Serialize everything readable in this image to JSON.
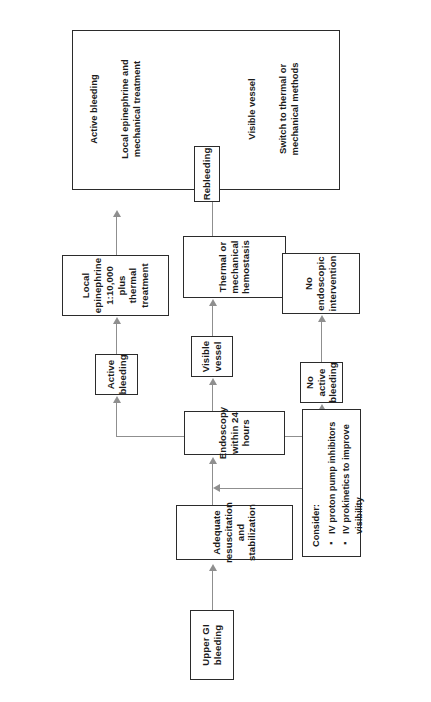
{
  "diagram": {
    "orientation_note": "rotated",
    "colors": {
      "background": "#ffffff",
      "box_border": "#2b2b2b",
      "connector": "#8f8f8f",
      "text": "#1b1b1b"
    },
    "nodes": {
      "start": "Upper GI bleeding",
      "resuscitation": "Adequate resuscitation and stabilization",
      "endoscopy": "Endoscopy within 24 hours",
      "active_bleeding": "Active bleeding",
      "visible_vessel": "Visible vessel",
      "no_active_bleeding": "No active bleeding",
      "epinephrine": "Local epinephrine 1:10,000 plus thermal treatment",
      "thermal": "Thermal or mechanical hemostasis",
      "no_intervention": "No endoscopic intervention",
      "rebleeding": "Rebleeding"
    },
    "note": {
      "title": "Consider:",
      "items": [
        "IV proton pump inhibitors",
        "IV prokinetics to improve visibility"
      ]
    },
    "outcome_panel": {
      "column_1_heading": "Active bleeding",
      "column_1_action": "Local epinephrine and mechanical treatment",
      "column_2_heading": "Visible vessel",
      "column_2_action": "Switch to thermal or mechanical methods"
    }
  }
}
